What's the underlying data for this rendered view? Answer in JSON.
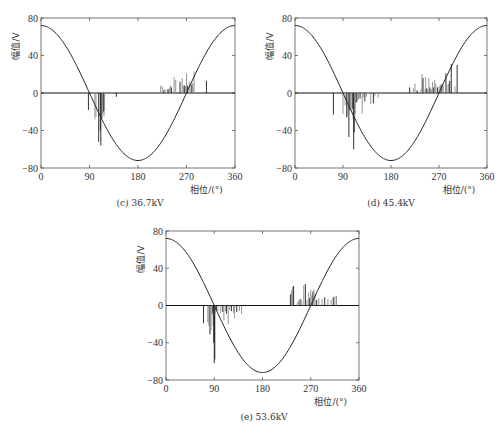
{
  "chart_data": [
    {
      "id": "c",
      "type": "bar",
      "title": "(c) 36.7kV",
      "xlabel": "相位/(°)",
      "ylabel": "幅值/V",
      "xlim": [
        0,
        360
      ],
      "ylim": [
        -80,
        80
      ],
      "xticks": [
        0,
        90,
        180,
        270,
        360
      ],
      "yticks": [
        80,
        40,
        0,
        -40,
        -80
      ],
      "reference_sine": {
        "amplitude": 72,
        "form": "cos"
      },
      "bars": [
        {
          "x": 88,
          "y": -18
        },
        {
          "x": 100,
          "y": -28
        },
        {
          "x": 102,
          "y": -25
        },
        {
          "x": 107,
          "y": -52
        },
        {
          "x": 110,
          "y": -40
        },
        {
          "x": 111,
          "y": -56
        },
        {
          "x": 113,
          "y": -27
        },
        {
          "x": 114,
          "y": -21
        },
        {
          "x": 115,
          "y": -22
        },
        {
          "x": 116,
          "y": -20
        },
        {
          "x": 117,
          "y": -25
        },
        {
          "x": 118,
          "y": -19
        },
        {
          "x": 140,
          "y": -4
        },
        {
          "x": 222,
          "y": 8
        },
        {
          "x": 225,
          "y": 7
        },
        {
          "x": 228,
          "y": 3
        },
        {
          "x": 230,
          "y": 4
        },
        {
          "x": 234,
          "y": 4
        },
        {
          "x": 236,
          "y": 4
        },
        {
          "x": 238,
          "y": 5
        },
        {
          "x": 240,
          "y": 8
        },
        {
          "x": 242,
          "y": 6
        },
        {
          "x": 247,
          "y": 17
        },
        {
          "x": 250,
          "y": 14
        },
        {
          "x": 258,
          "y": 12
        },
        {
          "x": 262,
          "y": 16
        },
        {
          "x": 264,
          "y": 8
        },
        {
          "x": 266,
          "y": 8
        },
        {
          "x": 268,
          "y": 7
        },
        {
          "x": 270,
          "y": 21
        },
        {
          "x": 272,
          "y": 8
        },
        {
          "x": 275,
          "y": 12
        },
        {
          "x": 278,
          "y": 10
        },
        {
          "x": 280,
          "y": 9
        },
        {
          "x": 282,
          "y": 11
        },
        {
          "x": 284,
          "y": 23
        },
        {
          "x": 307,
          "y": 13
        }
      ]
    },
    {
      "id": "d",
      "type": "bar",
      "title": "(d) 45.4kV",
      "xlabel": "相位/(°)",
      "ylabel": "幅值/V",
      "xlim": [
        0,
        360
      ],
      "ylim": [
        -80,
        80
      ],
      "xticks": [
        0,
        90,
        180,
        270,
        360
      ],
      "yticks": [
        80,
        40,
        0,
        -40,
        -80
      ],
      "reference_sine": {
        "amplitude": 72,
        "form": "cos"
      },
      "bars": [
        {
          "x": 72,
          "y": -23
        },
        {
          "x": 90,
          "y": -22
        },
        {
          "x": 94,
          "y": -13
        },
        {
          "x": 97,
          "y": -26
        },
        {
          "x": 99,
          "y": -24
        },
        {
          "x": 101,
          "y": -47
        },
        {
          "x": 103,
          "y": -18
        },
        {
          "x": 105,
          "y": -20
        },
        {
          "x": 107,
          "y": -15
        },
        {
          "x": 108,
          "y": -17
        },
        {
          "x": 109,
          "y": -28
        },
        {
          "x": 110,
          "y": -60
        },
        {
          "x": 111,
          "y": -42
        },
        {
          "x": 112,
          "y": -26
        },
        {
          "x": 113,
          "y": -22
        },
        {
          "x": 115,
          "y": -10
        },
        {
          "x": 117,
          "y": -9
        },
        {
          "x": 119,
          "y": -7
        },
        {
          "x": 122,
          "y": -6
        },
        {
          "x": 126,
          "y": -22
        },
        {
          "x": 128,
          "y": -5
        },
        {
          "x": 131,
          "y": -9
        },
        {
          "x": 134,
          "y": -4
        },
        {
          "x": 142,
          "y": -12
        },
        {
          "x": 147,
          "y": -11
        },
        {
          "x": 150,
          "y": -3
        },
        {
          "x": 156,
          "y": -5
        },
        {
          "x": 215,
          "y": 6
        },
        {
          "x": 222,
          "y": 5
        },
        {
          "x": 225,
          "y": 10
        },
        {
          "x": 229,
          "y": 3
        },
        {
          "x": 236,
          "y": 4
        },
        {
          "x": 238,
          "y": 20
        },
        {
          "x": 240,
          "y": 16
        },
        {
          "x": 242,
          "y": 4
        },
        {
          "x": 245,
          "y": 17
        },
        {
          "x": 247,
          "y": 5
        },
        {
          "x": 249,
          "y": 4
        },
        {
          "x": 251,
          "y": 16
        },
        {
          "x": 253,
          "y": 6
        },
        {
          "x": 256,
          "y": 4
        },
        {
          "x": 258,
          "y": 12
        },
        {
          "x": 260,
          "y": 6
        },
        {
          "x": 262,
          "y": 14
        },
        {
          "x": 264,
          "y": 10
        },
        {
          "x": 267,
          "y": 6
        },
        {
          "x": 270,
          "y": 7
        },
        {
          "x": 272,
          "y": 8
        },
        {
          "x": 274,
          "y": 9
        },
        {
          "x": 276,
          "y": 10
        },
        {
          "x": 278,
          "y": 8
        },
        {
          "x": 283,
          "y": 21
        },
        {
          "x": 285,
          "y": 9
        },
        {
          "x": 288,
          "y": 10
        },
        {
          "x": 290,
          "y": 13
        },
        {
          "x": 293,
          "y": 31
        },
        {
          "x": 300,
          "y": 7
        },
        {
          "x": 304,
          "y": 30
        }
      ]
    },
    {
      "id": "e",
      "type": "bar",
      "title": "(e) 53.6kV",
      "xlabel": "相位/(°)",
      "ylabel": "幅值/V",
      "xlim": [
        0,
        360
      ],
      "ylim": [
        -80,
        80
      ],
      "xticks": [
        0,
        90,
        180,
        270,
        360
      ],
      "yticks": [
        80,
        40,
        0,
        -40,
        -80
      ],
      "reference_sine": {
        "amplitude": 72,
        "form": "cos"
      },
      "bars": [
        {
          "x": 70,
          "y": -19
        },
        {
          "x": 78,
          "y": -18
        },
        {
          "x": 80,
          "y": -22
        },
        {
          "x": 82,
          "y": -31
        },
        {
          "x": 84,
          "y": -27
        },
        {
          "x": 86,
          "y": -10
        },
        {
          "x": 87,
          "y": -8
        },
        {
          "x": 88,
          "y": -22
        },
        {
          "x": 89,
          "y": -40
        },
        {
          "x": 90,
          "y": -62
        },
        {
          "x": 91,
          "y": -58
        },
        {
          "x": 92,
          "y": -8
        },
        {
          "x": 94,
          "y": -5
        },
        {
          "x": 97,
          "y": -6
        },
        {
          "x": 102,
          "y": -8
        },
        {
          "x": 106,
          "y": -7
        },
        {
          "x": 108,
          "y": -16
        },
        {
          "x": 111,
          "y": -6
        },
        {
          "x": 113,
          "y": -9
        },
        {
          "x": 116,
          "y": -20
        },
        {
          "x": 119,
          "y": -5
        },
        {
          "x": 122,
          "y": -6
        },
        {
          "x": 126,
          "y": -8
        },
        {
          "x": 128,
          "y": -14
        },
        {
          "x": 132,
          "y": -7
        },
        {
          "x": 137,
          "y": -6
        },
        {
          "x": 141,
          "y": -9
        },
        {
          "x": 232,
          "y": 12
        },
        {
          "x": 234,
          "y": 16
        },
        {
          "x": 236,
          "y": 20
        },
        {
          "x": 238,
          "y": 21
        },
        {
          "x": 245,
          "y": 3
        },
        {
          "x": 247,
          "y": 5
        },
        {
          "x": 250,
          "y": 7
        },
        {
          "x": 253,
          "y": 6
        },
        {
          "x": 257,
          "y": 22
        },
        {
          "x": 260,
          "y": 23
        },
        {
          "x": 263,
          "y": 6
        },
        {
          "x": 266,
          "y": 14
        },
        {
          "x": 268,
          "y": 8
        },
        {
          "x": 270,
          "y": 17
        },
        {
          "x": 272,
          "y": 11
        },
        {
          "x": 274,
          "y": 15
        },
        {
          "x": 276,
          "y": 17
        },
        {
          "x": 278,
          "y": 12
        },
        {
          "x": 281,
          "y": 6
        },
        {
          "x": 285,
          "y": 8
        },
        {
          "x": 291,
          "y": 7
        },
        {
          "x": 296,
          "y": 9
        },
        {
          "x": 302,
          "y": 7
        },
        {
          "x": 308,
          "y": 6
        },
        {
          "x": 312,
          "y": 9
        },
        {
          "x": 315,
          "y": 10
        },
        {
          "x": 318,
          "y": 10
        }
      ]
    }
  ],
  "panels": [
    {
      "caption": "(c) 36.7kV",
      "ylabel": "幅值/V",
      "xlabel": "相位/(°)"
    },
    {
      "caption": "(d) 45.4kV",
      "ylabel": "幅值/V",
      "xlabel": "相位/(°)"
    },
    {
      "caption": "(e) 53.6kV",
      "ylabel": "幅值/V",
      "xlabel": "相位/(°)"
    }
  ],
  "colors": {
    "axis": "#555555",
    "curve": "#222222",
    "bar_dark": "#1a1a1a",
    "bar_light": "#8a8a8a"
  }
}
